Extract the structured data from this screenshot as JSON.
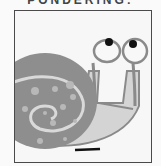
{
  "caption": "PONDERING:",
  "illustration": {
    "subject": "snail",
    "colors": {
      "shell": "#8e8e8e",
      "shell_spiral": "#d9d9d9",
      "body": "#d4d4d4",
      "outline": "#8a8a8a",
      "pupil": "#111111",
      "eye": "#f8f8f8",
      "frame_border": "#4a4a4a",
      "background": "#f7f7f7"
    }
  }
}
